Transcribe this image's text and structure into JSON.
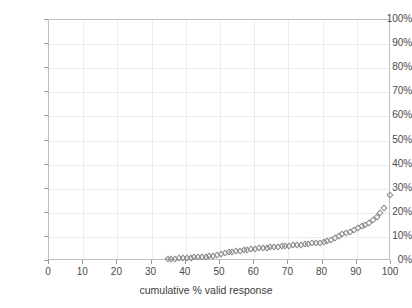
{
  "chart_data": {
    "type": "scatter",
    "title": "",
    "xlabel": "cumulative % valid response",
    "ylabel": "",
    "xlim": [
      0,
      100
    ],
    "ylim": [
      0,
      1.0
    ],
    "grid": true,
    "legend": null,
    "marker": "open-diamond",
    "marker_color": "#8a8a8a",
    "x_ticks": [
      0,
      10,
      20,
      30,
      40,
      50,
      60,
      70,
      80,
      90,
      100
    ],
    "x_tick_labels": [
      "0",
      "10",
      "20",
      "30",
      "40",
      "50",
      "60",
      "70",
      "80",
      "90",
      "100"
    ],
    "y_ticks": [
      0,
      0.1,
      0.2,
      0.3,
      0.4,
      0.5,
      0.6,
      0.7,
      0.8,
      0.9,
      1.0
    ],
    "y_tick_labels": [
      "0%",
      "10%",
      "20%",
      "30%",
      "40%",
      "50%",
      "60%",
      "70%",
      "80%",
      "90%",
      "100%"
    ],
    "x": [
      35.0,
      36.1,
      37.2,
      38.3,
      39.4,
      40.6,
      41.7,
      42.8,
      43.9,
      45.0,
      46.1,
      47.2,
      48.3,
      49.4,
      50.6,
      51.7,
      52.8,
      53.9,
      55.0,
      56.1,
      57.2,
      58.3,
      59.4,
      60.6,
      61.7,
      62.8,
      63.9,
      65.0,
      66.1,
      67.2,
      68.3,
      69.4,
      70.6,
      71.7,
      72.8,
      73.9,
      75.0,
      76.1,
      77.2,
      78.3,
      79.4,
      80.6,
      81.7,
      82.8,
      83.9,
      85.0,
      86.1,
      87.2,
      88.3,
      89.4,
      90.6,
      91.7,
      92.8,
      93.9,
      95.0,
      96.1,
      97.2,
      98.3,
      100.0
    ],
    "y": [
      0.004,
      0.005,
      0.006,
      0.007,
      0.008,
      0.009,
      0.01,
      0.011,
      0.012,
      0.013,
      0.014,
      0.015,
      0.017,
      0.02,
      0.026,
      0.03,
      0.033,
      0.035,
      0.037,
      0.039,
      0.041,
      0.043,
      0.044,
      0.046,
      0.048,
      0.049,
      0.051,
      0.052,
      0.054,
      0.055,
      0.057,
      0.058,
      0.06,
      0.061,
      0.063,
      0.064,
      0.066,
      0.067,
      0.069,
      0.07,
      0.072,
      0.074,
      0.077,
      0.082,
      0.09,
      0.1,
      0.108,
      0.113,
      0.118,
      0.124,
      0.132,
      0.14,
      0.147,
      0.155,
      0.165,
      0.178,
      0.196,
      0.215,
      0.268
    ]
  },
  "colors": {
    "gridline": "#ececec",
    "frame": "#bfbfbf",
    "tick": "#9a9a9a",
    "text": "#4a4a4a",
    "marker": "#8a8a8a"
  }
}
